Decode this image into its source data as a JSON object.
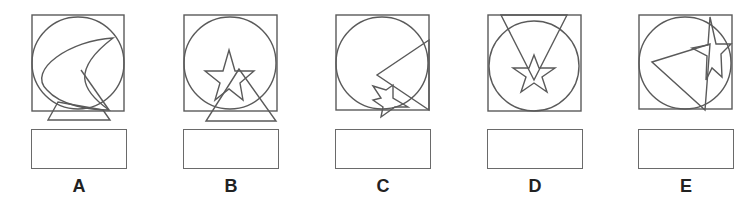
{
  "colors": {
    "stroke": "#5a5a5a",
    "box_border": "#6a6a6a",
    "label": "#222222"
  },
  "options": [
    {
      "label": "A",
      "x": 32,
      "box_x": 32,
      "frame": {
        "x": 1,
        "y": 5,
        "w": 92,
        "h": 96
      },
      "circle": {
        "cx": 47,
        "cy": 53,
        "r": 46
      },
      "shapes": [
        {
          "kind": "path",
          "d": "M 82 28 C 40 30, -5 60, 16 80 C 30 96, 60 100, 78 100 C 50 80, 40 60, 82 28 Z"
        },
        {
          "kind": "polyline",
          "points": "50 60 78 100"
        },
        {
          "kind": "polygon",
          "points": "27 92 17 110 79 110 72 100"
        }
      ]
    },
    {
      "label": "B",
      "x": 184,
      "box_x": 184,
      "frame": {
        "x": 1,
        "y": 5,
        "w": 93,
        "h": 96
      },
      "circle": {
        "cx": 47,
        "cy": 53,
        "r": 46
      },
      "shapes": [
        {
          "kind": "polygon",
          "points": "46 40 52 61 71 61 57 73 60 90 46 79 32 90 37 73 22 61 40 61"
        },
        {
          "kind": "polygon",
          "points": "56 59 23 111 93 111"
        }
      ]
    },
    {
      "label": "C",
      "x": 336,
      "box_x": 336,
      "frame": {
        "x": 1,
        "y": 5,
        "w": 93,
        "h": 95
      },
      "circle": {
        "cx": 47,
        "cy": 53,
        "r": 46
      },
      "shapes": [
        {
          "kind": "polygon",
          "points": "94 30 42 65 94 100"
        },
        {
          "kind": "polygon",
          "points": "38 76 51 80 58 75 58 88 73 97 60 97 46 107 48 97 38 90 46 88"
        }
      ]
    },
    {
      "label": "D",
      "x": 488,
      "box_x": 488,
      "frame": {
        "x": 1,
        "y": 5,
        "w": 93,
        "h": 96
      },
      "circle": {
        "cx": 47,
        "cy": 56,
        "r": 45
      },
      "shapes": [
        {
          "kind": "polygon",
          "points": "14 5 80 5 47 70"
        },
        {
          "kind": "polygon",
          "points": "47 45 52 58 68 58 55 67 60 82 47 73 34 82 39 67 26 58 42 58"
        }
      ]
    },
    {
      "label": "E",
      "x": 639,
      "box_x": 639,
      "frame": {
        "x": 1,
        "y": 5,
        "w": 93,
        "h": 94
      },
      "circle": {
        "cx": 47,
        "cy": 53,
        "r": 46
      },
      "shapes": [
        {
          "kind": "polygon",
          "points": "72 7 78 34 93 34 83 44 84 67 74 58 68 70 69 46 54 38 70 35"
        },
        {
          "kind": "polygon",
          "points": "14 52 72 34 67 100"
        }
      ]
    }
  ]
}
